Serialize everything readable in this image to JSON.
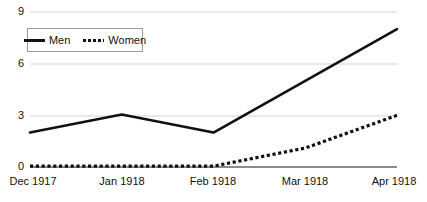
{
  "chart_data": {
    "type": "line",
    "title": "",
    "subtitle": "",
    "xlabel": "",
    "ylabel": "",
    "categories": [
      "Dec 1917",
      "Jan 1918",
      "Feb 1918",
      "Mar 1918",
      "Apr 1918"
    ],
    "series": [
      {
        "name": "Men",
        "style": "solid",
        "color": "#111111",
        "values": [
          2.0,
          3.05,
          2.0,
          5.0,
          8.0
        ]
      },
      {
        "name": "Women",
        "style": "dotted",
        "color": "#111111",
        "values": [
          0.05,
          0.05,
          0.05,
          1.1,
          3.0
        ]
      }
    ],
    "ylim": [
      0,
      9
    ],
    "yticks": [
      0,
      3,
      6,
      9
    ],
    "ytick_labels": [
      "0",
      "3",
      "6",
      "9"
    ],
    "grid": true,
    "grid_axis": "y",
    "grid_color": "#e2e2e2",
    "axis_color": "#8c8c8c",
    "background": "#ffffff",
    "legend_position": "top-left"
  },
  "yaxis": {
    "labels": [
      "9",
      "6",
      "3",
      "0"
    ]
  },
  "xaxis": {
    "labels": [
      "Dec 1917",
      "Jan 1918",
      "Feb 1918",
      "Mar 1918",
      "Apr 1918"
    ]
  },
  "legend": {
    "men_label": "Men",
    "women_label": "Women"
  }
}
